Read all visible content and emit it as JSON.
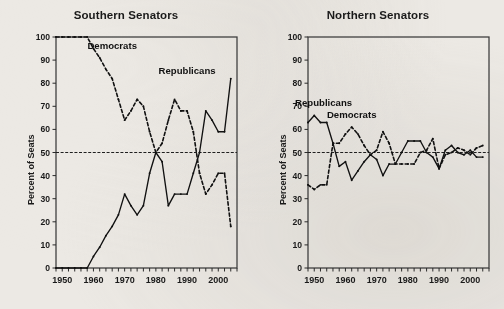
{
  "figure": {
    "background_color": "#ece9e4",
    "ink_color": "#111111",
    "panels": [
      "Southern Senators",
      "Northern Senators"
    ]
  },
  "chart_data": [
    {
      "type": "line",
      "title": "Southern Senators",
      "xlabel": "",
      "ylabel": "Percent of Seats",
      "xlim": [
        1948,
        2006
      ],
      "ylim": [
        0,
        100
      ],
      "grid": false,
      "legend": "inline-annotation",
      "y_ticks": [
        0,
        10,
        20,
        30,
        40,
        50,
        60,
        70,
        80,
        90,
        100
      ],
      "x_ticks": [
        1948,
        1950,
        1952,
        1954,
        1956,
        1958,
        1960,
        1962,
        1964,
        1966,
        1968,
        1970,
        1972,
        1974,
        1976,
        1978,
        1980,
        1982,
        1984,
        1986,
        1988,
        1990,
        1992,
        1994,
        1996,
        1998,
        2000,
        2002,
        2004,
        2006
      ],
      "x_tick_labels": [
        1950,
        1960,
        1970,
        1980,
        1990,
        2000
      ],
      "annotations": [
        {
          "text": "Democrats",
          "x": 1966,
          "y": 95
        },
        {
          "text": "Republicans",
          "x": 1990,
          "y": 84
        }
      ],
      "reference_line": {
        "y": 50,
        "style": "dash-dot"
      },
      "x": [
        1948,
        1950,
        1952,
        1954,
        1956,
        1958,
        1960,
        1962,
        1964,
        1966,
        1968,
        1970,
        1972,
        1974,
        1976,
        1978,
        1980,
        1982,
        1984,
        1986,
        1988,
        1990,
        1992,
        1994,
        1996,
        1998,
        2000,
        2002,
        2004
      ],
      "series": [
        {
          "name": "Democrats",
          "style": "dashed",
          "values": [
            100,
            100,
            100,
            100,
            100,
            100,
            95,
            91,
            86,
            82,
            73,
            64,
            68,
            73,
            70,
            59,
            50,
            54,
            64,
            73,
            68,
            68,
            59,
            41,
            32,
            36,
            41,
            41,
            18
          ]
        },
        {
          "name": "Republicans",
          "style": "solid",
          "values": [
            0,
            0,
            0,
            0,
            0,
            0,
            5,
            9,
            14,
            18,
            23,
            32,
            27,
            23,
            27,
            41,
            50,
            46,
            27,
            32,
            32,
            32,
            41,
            50,
            68,
            64,
            59,
            59,
            82
          ]
        }
      ]
    },
    {
      "type": "line",
      "title": "Northern Senators",
      "xlabel": "",
      "ylabel": "Percent of Seats",
      "xlim": [
        1948,
        2006
      ],
      "ylim": [
        0,
        100
      ],
      "grid": false,
      "legend": "inline-annotation",
      "y_ticks": [
        0,
        10,
        20,
        30,
        40,
        50,
        60,
        70,
        80,
        90,
        100
      ],
      "x_ticks": [
        1948,
        1950,
        1952,
        1954,
        1956,
        1958,
        1960,
        1962,
        1964,
        1966,
        1968,
        1970,
        1972,
        1974,
        1976,
        1978,
        1980,
        1982,
        1984,
        1986,
        1988,
        1990,
        1992,
        1994,
        1996,
        1998,
        2000,
        2002,
        2004,
        2006
      ],
      "x_tick_labels": [
        1950,
        1960,
        1970,
        1980,
        1990,
        2000
      ],
      "annotations": [
        {
          "text": "Republicans",
          "x": 1953,
          "y": 70
        },
        {
          "text": "Democrats",
          "x": 1962,
          "y": 65
        }
      ],
      "reference_line": {
        "y": 50,
        "style": "dash-dot"
      },
      "x": [
        1948,
        1950,
        1952,
        1954,
        1956,
        1958,
        1960,
        1962,
        1964,
        1966,
        1968,
        1970,
        1972,
        1974,
        1976,
        1978,
        1980,
        1982,
        1984,
        1986,
        1988,
        1990,
        1992,
        1994,
        1996,
        1998,
        2000,
        2002,
        2004
      ],
      "series": [
        {
          "name": "Republicans",
          "style": "solid",
          "values": [
            63,
            66,
            63,
            63,
            54,
            44,
            46,
            38,
            42,
            46,
            49,
            47,
            40,
            45,
            45,
            50,
            55,
            55,
            55,
            50,
            48,
            43,
            51,
            53,
            50,
            49,
            51,
            48,
            48
          ]
        },
        {
          "name": "Democrats",
          "style": "dashed",
          "values": [
            36,
            34,
            36,
            36,
            54,
            54,
            58,
            61,
            58,
            53,
            49,
            51,
            59,
            54,
            45,
            45,
            45,
            45,
            50,
            51,
            56,
            43,
            49,
            50,
            52,
            51,
            49,
            52,
            53
          ]
        }
      ]
    }
  ]
}
